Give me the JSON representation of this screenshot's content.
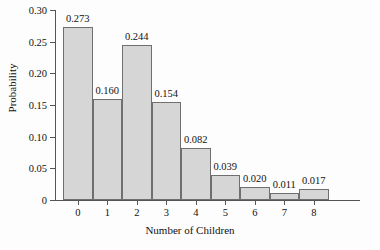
{
  "chart_data": {
    "type": "bar",
    "title": "",
    "xlabel": "Number of Children",
    "ylabel": "Probability",
    "categories": [
      "0",
      "1",
      "2",
      "3",
      "4",
      "5",
      "6",
      "7",
      "8"
    ],
    "values": [
      0.273,
      0.16,
      0.244,
      0.154,
      0.082,
      0.039,
      0.02,
      0.011,
      0.017
    ],
    "data_labels": [
      "0.273",
      "0.160",
      "0.244",
      "0.154",
      "0.082",
      "0.039",
      "0.020",
      "0.011",
      "0.017"
    ],
    "ylim": [
      0,
      0.3
    ],
    "yticks": [
      0,
      0.05,
      0.1,
      0.15,
      0.2,
      0.25,
      0.3
    ],
    "ytick_labels": [
      "0",
      "0.05",
      "0.10",
      "0.15",
      "0.20",
      "0.25",
      "0.30"
    ],
    "xlim": [
      -0.5,
      8.5
    ],
    "grid": false,
    "legend": null,
    "bar_fill_color": "#d6d6d6",
    "bar_edge_color": "#6f6f6f",
    "axis_color": "#555555",
    "background_color": "#fdfdfd"
  }
}
